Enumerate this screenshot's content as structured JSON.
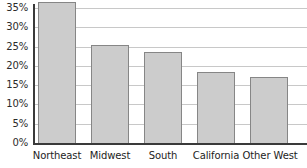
{
  "chart_data": {
    "type": "bar",
    "title": "",
    "xlabel": "",
    "ylabel": "",
    "categories": [
      "Northeast",
      "Midwest",
      "South",
      "California",
      "Other West"
    ],
    "values": [
      36.5,
      25.5,
      23.5,
      18.5,
      17.0
    ],
    "value_labels": [
      "36.5%",
      "25.5%",
      "23.5%",
      "18.5%",
      "17%"
    ],
    "ylim": [
      0,
      36.5
    ],
    "y_ticks": [
      0,
      5,
      10,
      15,
      20,
      25,
      30,
      35
    ],
    "y_tick_labels": [
      "0%",
      "5%",
      "10%",
      "15%",
      "20%",
      "25%",
      "30%",
      "35%"
    ],
    "grid": true,
    "legend": false,
    "legend_position": "none",
    "colors": {
      "bar_fill": "#cccccc",
      "bar_border": "#868686",
      "gridline": "#c8c8c8",
      "axis": "#3a3a3a",
      "tick_label": "#2b2b2b",
      "category_label": "#1d1d1d",
      "background": "#ffffff"
    }
  }
}
